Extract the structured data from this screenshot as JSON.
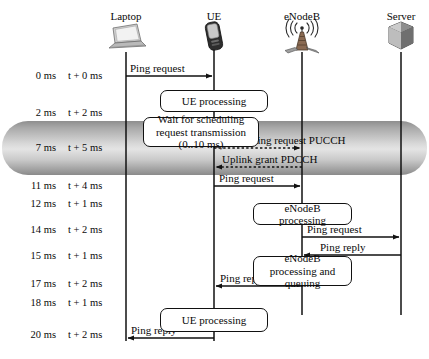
{
  "diagram": {
    "type": "sequence-diagram",
    "actors": [
      {
        "id": "laptop",
        "label": "Laptop",
        "icon": "laptop-icon",
        "x": 126
      },
      {
        "id": "ue",
        "label": "UE",
        "icon": "mobile-phone-icon",
        "x": 214
      },
      {
        "id": "enodeb",
        "label": "eNodeB",
        "icon": "cell-tower-icon",
        "x": 302
      },
      {
        "id": "server",
        "label": "Server",
        "icon": "server-icon",
        "x": 401
      }
    ],
    "time_rows": [
      {
        "absolute": "0 ms",
        "relative": "t + 0 ms",
        "y": 76
      },
      {
        "absolute": "2 ms",
        "relative": "t + 2 ms",
        "y": 113
      },
      {
        "absolute": "7 ms",
        "relative": "t + 5 ms",
        "y": 148
      },
      {
        "absolute": "11 ms",
        "relative": "t + 4 ms",
        "y": 186
      },
      {
        "absolute": "12 ms",
        "relative": "t + 1 ms",
        "y": 204
      },
      {
        "absolute": "14 ms",
        "relative": "t + 2 ms",
        "y": 230
      },
      {
        "absolute": "15 ms",
        "relative": "t + 1 ms",
        "y": 256
      },
      {
        "absolute": "17 ms",
        "relative": "t + 2 ms",
        "y": 284
      },
      {
        "absolute": "18 ms",
        "relative": "t + 1 ms",
        "y": 303
      },
      {
        "absolute": "20 ms",
        "relative": "t + 2 ms",
        "y": 335
      }
    ],
    "messages": [
      {
        "id": "m1",
        "label": "Ping request",
        "from": "laptop",
        "to": "ue",
        "y": 76,
        "dashed": false,
        "label_x": 130,
        "label_y": 64
      },
      {
        "id": "m2",
        "label": "Scheduling request PUCCH",
        "from": "ue",
        "to": "enodeb",
        "y": 148,
        "dashed": true,
        "label_x": 222,
        "label_y": 136
      },
      {
        "id": "m3",
        "label": "Uplink grant PDCCH",
        "from": "enodeb",
        "to": "ue",
        "y": 167,
        "dashed": true,
        "label_x": 222,
        "label_y": 155
      },
      {
        "id": "m4",
        "label": "Ping request",
        "from": "ue",
        "to": "enodeb",
        "y": 186,
        "dashed": false,
        "label_x": 219,
        "label_y": 174
      },
      {
        "id": "m5",
        "label": "Ping request",
        "from": "enodeb",
        "to": "server",
        "y": 237,
        "dashed": false,
        "label_x": 307,
        "label_y": 225
      },
      {
        "id": "m6",
        "label": "Ping reply",
        "from": "server",
        "to": "enodeb",
        "y": 255,
        "dashed": false,
        "label_x": 317,
        "label_y": 243
      },
      {
        "id": "m7",
        "label": "Ping reply",
        "from": "enodeb",
        "to": "ue",
        "y": 286,
        "dashed": false,
        "label_x": 220,
        "label_y": 274
      },
      {
        "id": "m8",
        "label": "Ping reply",
        "from": "ue",
        "to": "laptop",
        "y": 338,
        "dashed": false,
        "label_x": 131,
        "label_y": 326
      }
    ],
    "process_boxes": [
      {
        "id": "p1",
        "label": "UE processing",
        "x": 160,
        "y": 90,
        "w": 108,
        "h": 22
      },
      {
        "id": "p2",
        "label": "Wait for scheduling request transmission (0..10 ms)",
        "x": 143,
        "y": 117,
        "w": 116,
        "h": 30
      },
      {
        "id": "p3",
        "label": "eNodeB processing",
        "x": 253,
        "y": 203,
        "w": 99,
        "h": 22
      },
      {
        "id": "p4",
        "label": "eNodeB processing and queuing",
        "x": 253,
        "y": 256,
        "w": 99,
        "h": 30
      },
      {
        "id": "p5",
        "label": "UE processing",
        "x": 160,
        "y": 308,
        "w": 108,
        "h": 24
      }
    ],
    "highlight_band": {
      "id": "radio-access-delay-band",
      "x": 2,
      "y": 121,
      "w": 425,
      "h": 54,
      "color_light": "#e4e4e4",
      "color_dark": "#8a8a8a"
    },
    "colors": {
      "line": "#111111",
      "background": "#ffffff",
      "box_fill": "#ffffff"
    }
  }
}
